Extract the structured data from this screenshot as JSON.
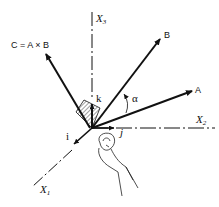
{
  "diagram": {
    "axes": {
      "x1": {
        "label": "X",
        "subscript": "1"
      },
      "x2": {
        "label": "X",
        "subscript": "2"
      },
      "x3": {
        "label": "X",
        "subscript": "3"
      }
    },
    "unit_vectors": {
      "i": "i",
      "j": "j",
      "k": "k"
    },
    "vectors": {
      "a": "A",
      "b": "B",
      "c": "C = A × B"
    },
    "angle": "α",
    "hand_icon": "right-hand-curl-icon"
  }
}
